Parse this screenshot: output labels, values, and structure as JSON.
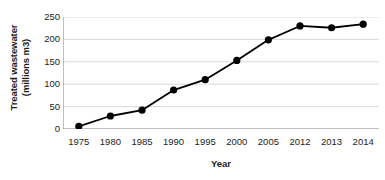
{
  "chart_data": {
    "type": "line",
    "title": "",
    "xlabel": "Year",
    "ylabel": "Treated wastewater (millions m3)",
    "ylabel_line1": "Treated wastewater",
    "ylabel_line2": "(millions m3)",
    "categories": [
      "1975",
      "1980",
      "1985",
      "1990",
      "1995",
      "2000",
      "2005",
      "2012",
      "2013",
      "2014"
    ],
    "values": [
      6,
      29,
      42,
      87,
      110,
      153,
      199,
      230,
      226,
      234
    ],
    "series": [
      {
        "name": "Treated wastewater",
        "values": [
          6,
          29,
          42,
          87,
          110,
          153,
          199,
          230,
          226,
          234
        ]
      }
    ],
    "ylim": [
      0,
      250
    ],
    "yticks": [
      0,
      50,
      100,
      150,
      200,
      250
    ],
    "ytick_labels": [
      "0",
      "50",
      "100",
      "150",
      "200",
      "250"
    ],
    "grid": true,
    "grid_axis": "y",
    "legend": false,
    "legend_position": "none",
    "line_color": "#000000",
    "marker_color": "#000000",
    "marker_shape": "circle",
    "grid_color": "#d9d9d9",
    "axis_color": "#808080",
    "background_color": "#ffffff"
  }
}
